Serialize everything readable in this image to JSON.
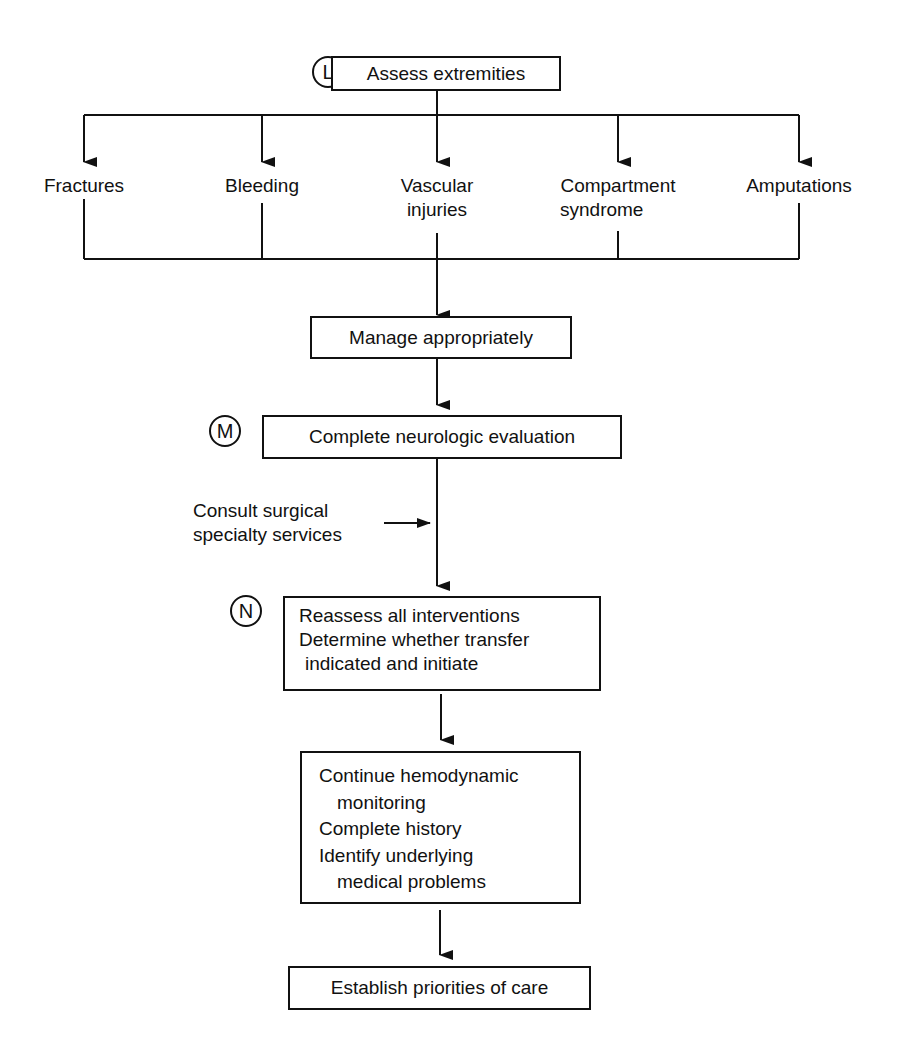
{
  "diagram": {
    "type": "flowchart",
    "step_markers": {
      "L": "L",
      "M": "M",
      "N": "N"
    },
    "nodes": {
      "assess": "Assess extremities",
      "branches": [
        {
          "line1": "Fractures",
          "line2": ""
        },
        {
          "line1": "Bleeding",
          "line2": ""
        },
        {
          "line1": "Vascular",
          "line2": "injuries"
        },
        {
          "line1": "Compartment",
          "line2": "syndrome"
        },
        {
          "line1": "Amputations",
          "line2": ""
        }
      ],
      "manage": "Manage appropriately",
      "neuro": "Complete neurologic evaluation",
      "consult": {
        "line1": "Consult surgical",
        "line2": "specialty services"
      },
      "reassess": {
        "line1": "Reassess all interventions",
        "line2": "Determine whether transfer",
        "line3": "indicated and initiate"
      },
      "continue": {
        "line1": "Continue hemodynamic",
        "line2": "monitoring",
        "line3": "Complete history",
        "line4": "Identify underlying",
        "line5": "medical problems"
      },
      "establish": "Establish priorities of care"
    },
    "edges": [
      [
        "assess",
        "Fractures"
      ],
      [
        "assess",
        "Bleeding"
      ],
      [
        "assess",
        "Vascular injuries"
      ],
      [
        "assess",
        "Compartment syndrome"
      ],
      [
        "assess",
        "Amputations"
      ],
      [
        "branches",
        "manage"
      ],
      [
        "manage",
        "neuro"
      ],
      [
        "consult",
        "neuro->reassess"
      ],
      [
        "neuro",
        "reassess"
      ],
      [
        "reassess",
        "continue"
      ],
      [
        "continue",
        "establish"
      ]
    ]
  }
}
